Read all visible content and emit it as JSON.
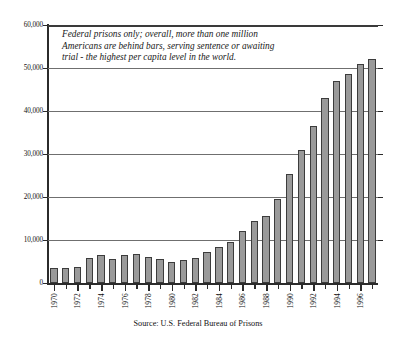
{
  "chart_data": {
    "type": "bar",
    "title": "",
    "subtitle": "",
    "xlabel": "",
    "ylabel": "",
    "ylim": [
      0,
      60000
    ],
    "ytick_values": [
      0,
      10000,
      20000,
      30000,
      40000,
      50000,
      60000
    ],
    "ytick_labels": [
      "0",
      "10,000",
      "20,000",
      "30,000",
      "40,000",
      "50,000",
      "60,000"
    ],
    "grid": true,
    "legend": "none",
    "categories": [
      "1970",
      "1971",
      "1972",
      "1973",
      "1974",
      "1975",
      "1976",
      "1977",
      "1978",
      "1979",
      "1980",
      "1981",
      "1982",
      "1983",
      "1984",
      "1985",
      "1986",
      "1987",
      "1988",
      "1989",
      "1990",
      "1991",
      "1992",
      "1993",
      "1994",
      "1995",
      "1996",
      "1997"
    ],
    "xtick_labels_shown": [
      "1970",
      "1972",
      "1974",
      "1976",
      "1978",
      "1980",
      "1982",
      "1984",
      "1986",
      "1988",
      "1990",
      "1992",
      "1994",
      "1996"
    ],
    "values": [
      3400,
      3500,
      3700,
      5900,
      6400,
      5600,
      6600,
      6700,
      6100,
      5600,
      4800,
      5400,
      5800,
      7200,
      8300,
      9500,
      12100,
      14400,
      15600,
      19600,
      25300,
      30900,
      36600,
      43100,
      47000,
      48500,
      51000,
      52000
    ],
    "annotation": {
      "line1": "Federal prisons only;  overall, more than one million",
      "line2": "Americans are behind bars, serving sentence or awaiting",
      "line3": "trial - the highest per capita level in the world."
    },
    "source": "Source: U.S. Federal Bureau of Prisons",
    "colors": {
      "bar_fill": "#9a9a9a",
      "bar_stroke": "#3c3c3c",
      "gridline": "#6f6f6f",
      "axis": "#2b2b2b",
      "background": "#ffffff",
      "text": "#111111"
    }
  }
}
